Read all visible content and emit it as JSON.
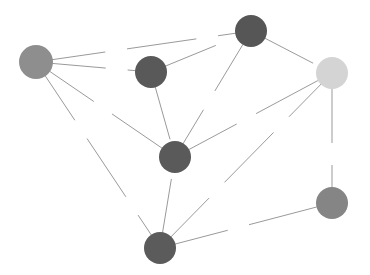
{
  "diagram": {
    "type": "network-graph",
    "width": 370,
    "height": 275,
    "edge_color": "#9a9a9a",
    "nodes": [
      {
        "id": "A",
        "x": 36,
        "y": 62,
        "r": 17,
        "color": "#8e8e8e"
      },
      {
        "id": "B",
        "x": 151,
        "y": 72,
        "r": 16,
        "color": "#595959"
      },
      {
        "id": "C",
        "x": 251,
        "y": 31,
        "r": 16,
        "color": "#565656"
      },
      {
        "id": "D",
        "x": 332,
        "y": 73,
        "r": 16,
        "color": "#d4d4d4"
      },
      {
        "id": "E",
        "x": 175,
        "y": 157,
        "r": 16,
        "color": "#5a5a5a"
      },
      {
        "id": "F",
        "x": 332,
        "y": 203,
        "r": 16,
        "color": "#858585"
      },
      {
        "id": "G",
        "x": 160,
        "y": 248,
        "r": 16,
        "color": "#5b5b5b"
      }
    ],
    "edges": [
      {
        "from": "A",
        "to": "C"
      },
      {
        "from": "A",
        "to": "B"
      },
      {
        "from": "A",
        "to": "E"
      },
      {
        "from": "A",
        "to": "G"
      },
      {
        "from": "B",
        "to": "C"
      },
      {
        "from": "B",
        "to": "E"
      },
      {
        "from": "C",
        "to": "E"
      },
      {
        "from": "C",
        "to": "D"
      },
      {
        "from": "E",
        "to": "D"
      },
      {
        "from": "G",
        "to": "D"
      },
      {
        "from": "G",
        "to": "E"
      },
      {
        "from": "G",
        "to": "F"
      },
      {
        "from": "D",
        "to": "F"
      }
    ]
  }
}
